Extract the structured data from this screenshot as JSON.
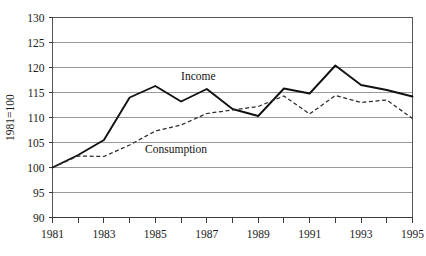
{
  "chart_data": {
    "type": "line",
    "title": "",
    "subtitle": "",
    "xlabel": "",
    "ylabel": "1981=100",
    "x": [
      1981,
      1982,
      1983,
      1984,
      1985,
      1986,
      1987,
      1988,
      1989,
      1990,
      1991,
      1992,
      1993,
      1994,
      1995
    ],
    "categories": [
      "1981",
      "1982",
      "1983",
      "1984",
      "1985",
      "1986",
      "1987",
      "1988",
      "1989",
      "1990",
      "1991",
      "1992",
      "1993",
      "1994",
      "1995"
    ],
    "xlim": [
      1981,
      1995
    ],
    "ylim": [
      90,
      130
    ],
    "yticks": [
      90,
      95,
      100,
      105,
      110,
      115,
      120,
      125,
      130
    ],
    "ytick_labels": [
      "90",
      "95",
      "100",
      "105",
      "110",
      "115",
      "120",
      "125",
      "130"
    ],
    "xticks": [
      1981,
      1982,
      1983,
      1984,
      1985,
      1986,
      1987,
      1988,
      1989,
      1990,
      1991,
      1992,
      1993,
      1994,
      1995
    ],
    "xtick_labels_shown": [
      "1981",
      "1983",
      "1985",
      "1987",
      "1989",
      "1991",
      "1993",
      "1995"
    ],
    "grid": true,
    "grid_axis": "y",
    "legend": "inline-annotations",
    "legend_position": "inside-plot",
    "series": [
      {
        "name": "Income",
        "style": "solid",
        "color": "#111111",
        "label_x": 1986.0,
        "label_y": 117.6,
        "values": [
          100,
          102.5,
          105.5,
          114.0,
          116.3,
          113.2,
          115.7,
          111.7,
          110.3,
          115.8,
          114.8,
          120.4,
          116.5,
          115.5,
          114.2
        ]
      },
      {
        "name": "Consumption",
        "style": "dashed",
        "color": "#2b2b2b",
        "label_x": 1984.6,
        "label_y": 102.9,
        "values": [
          100,
          102.3,
          102.2,
          104.5,
          107.3,
          108.5,
          110.8,
          111.5,
          112.2,
          114.3,
          110.7,
          114.4,
          113.0,
          113.5,
          109.8
        ]
      }
    ],
    "annotations": [
      {
        "text": "Income",
        "x": 1986.0,
        "y": 117.6
      },
      {
        "text": "Consumption",
        "x": 1984.6,
        "y": 102.9
      }
    ]
  }
}
